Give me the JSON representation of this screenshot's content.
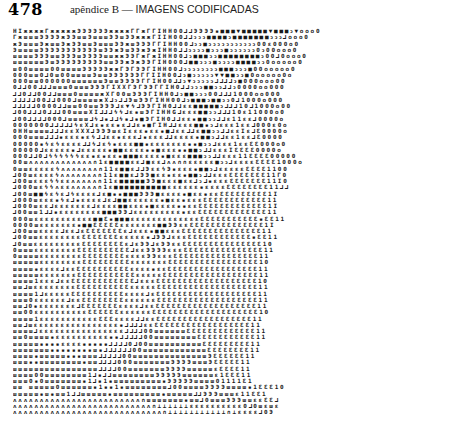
{
  "header": {
    "page_number": "478",
    "running_head_prefix": "apêndice B — ",
    "running_head_title": "IMAGENS CODIFICADAS"
  },
  "grid": {
    "columns": 61,
    "rows": [
      "HIжжжжГжжжжжЭЭЭЭЭЭжжжжГГжГГIHH00⅃⅃ЭЭЭЭ▪■■■▼■■■■■▼■■■ↄ▼ooo0",
      "ГжшшшЭЭЭЭжЭЭшшЭшшшЭЭшЭЭжжжГIIH00⅃⅃ↄↄↄ■■■■ↄ■■■■■■■ↄↄↄ⅃ooo0",
      "жЭшшшЭжшшЭжЭЭшшЭшшшЭЭжшЭЭЭГГIHH00⅃ↄↄ■ↄↄↄↄↄↄↄↄↄↄↄ00ɛ000o0",
      "ЭшшшшЭЭЭЭЭЭЭЭЭЭЭшЭЭжЭшЭЭжЭжIHH0⅃⅃ↄↄↄↄ■ↄↄↄ■ↄↄↄↄↄↄ0ↄ00ooo0",
      "шшшшЭЭЭшшЭЭЭшЭЭЭЭшшжжЭЭГжГжIHH00⅃ↄ■■■ↄↄ■■■■■■■■ↄ00⅃0ooo0",
      "шшшшшшЭшЭЭЭЭЭЭЭЭЭшшЭЭжЭжЭЭГIH000⅃■■ↄↄↄ■ↄↄↄↄ■■■■ↄↄ0ooooo0",
      "ш00шшшш00шшшшЭЭЭЭЭжжГЭГЭЭГIHH00⅃ↄↄↄↄↄↄↄↄ■■■ↄↄↄ■00ooooo0",
      "000шш0⅃0ш00шшшшЭшшЭЭЭЭЭЭГГIIH00⅃ↄ■ↄↄↄↄↄ▼▼■■ↄↄ■0ooooo0o",
      "000шш000000шшшшшшЭшшЭЭЭЭГГIH00⅃⅃ↄ▼ↄↄↄↄↄ⅃⅃⅃⅃ↄ■000ooo00",
      "0⅃⅃00⅃⅃⅃шшш0шшшЭЭЭГIXXГЭГЭЭГГIH0⅃⅃ↄↄↄ■■ↄↄ⅃⅃ↄ0000oo000",
      "⅃⅃0⅃⅃00⅃⅃шшш0шшшшжXГ00шЭЭЭГIHH0⅃ↄ■■ↄↄↄ00⅃⅃⅃1000oo000",
      "⅃⅃⅃⅃⅃00⅃⅃000⅃шшшшжX⅃ↄ⅃⅃ЭшЭЭГIHH00⅃ↄ■■■ↄ■■ↄↄ0⅃1000o000",
      "⅃⅃⅃⅃⅃0000⅃⅃шш00шшЭЭЭ⅃ɛ▼ϟ⅃ЭЭГIH0⅃⅃ɛɛ■■■■■ↄ⅃⅃⅃10⅃1000o00",
      "⅃00⅃⅃⅃0⅃⅃⅃00шшшXI⅃⅃⅃ϟϟ⅃ɛ▪шЭГIHHG⅃ɛɛɛ■■ↄↄ⅃⅃⅃10ɛ11000o0",
      "⅃00⅃⅃⅃⅃000⅃шшшш⅃ϟ⅃▪⅃⅃ϟ▪⅃▪■ЭГIH0⅃⅃ɛɛ▪■■ↄↄ⅃⅃ɛ11ɛɛ⅃0000o",
      "0000000⅃⅃⅃⅃⅃ϟɛX⅃ɛ▪ɛɛ▪ɛ⅃⅃ɛ▪■ГIH⅃⅃ɛɛɛ■■▪ↄ⅃ɛɛɛ1ɛɛ⅃000ɛ0o",
      "0HHшшшш⅃⅃⅃ɛɛXXX⅃ЭЭЭшɛIɛɛɛ▪ɛɛ▪■⅃ɛɛ⅃⅃ɛ■■ↄↄ⅃⅃ɛɛIɛ⅃Ɛ0000o",
      "000шшш⅃⅃⅃▪ɛɛɛ▪ɛϟ⅃⅃ɛɛ▪ɛɛɛ⅃▪ɛɛɛ⅃⅃ɛɛɛɛ▪■■ↄ⅃⅃ɛɛ1ɛɛ⅃Ɛ0000",
      "00000▪ϟɛϟɛɛɛɛ⅃⅃ϟ⅃ɛϟ▪ɛɛɛ■■▪ɛɛɛɛɛɛɛ▪▪■ↄↄ⅃ɛɛɛ1ɛɛƐƐ000o0",
      "00000⅃ɛɛɛɛɛ▪⅃ɛɛɛɛɛ▪■■ɛɛɛɛ▪▪■ɛɛɛ▪▪■■ↄ⅃⅃ɛɛɛIƐƐƐƐ0000o",
      "000⅃⅃0⅃ϟϟϟϟϟϟɛɛ▪ɛ▪ɛɛ▪■■■ɛɛɛɛ▪■ɛɛɛ■■■ↄↄ⅃⅃ɛɛɛ11ƐƐƐƐ00000",
      "00шʌʌʌʌʌʌʌʌʌʌʌʌ∩1ɛ■■■■ɛɛ⅃■ɛɛ⅃ʌʌ∩∩ɛɛɛɛɛ■ↄↄ⅃ɛɛɛɛƐƐƐƐ1000o",
      "0шшɛɛɛɛɛϟʌʌʌʌʌʌʌ∩11ɛ■■ɛ⅃⅃ЭɛɛϟЭ▪ɛɛɛ▪■■ↄ⅃ɛɛɛɛɛƐƐƐƐ1100",
      "⅃00шɛɛɛɛϟʌʌʌʌʌʌʌ∩11ɛ■■ɛ⅃ЭЭ■ɛɛ▪ɛɛ▪■■ↄ⅃⅃ɛɛɛƐƐƐƐƐƐƐ11Г0",
      "⅃00шɛɛɛϟϟɛɛʌʌʌʌʌ∩11ɛ■■■■■ЭЭ■ɛɛɛ■ɛɛ⅃ↄ⅃▪ɛɛɛƐƐƐƐƐƐƐ11I0",
      "⅃000шɛϟϟʌɛɛʌʌʌʌʌ∩1ɛ■■■■■■■■■■ɛɛɛɛɛɛ▪ɛɛɛɛƐƐƐƐƐƐƐƐ11⅃⅃",
      "⅃00ш■■ϟɛϟɛ⅃ϟɛɛɛɛ⅃ɛ■▪▪■■■ЭЭЭ■ɛɛɛɛ▪■ɛɛ▪ɛɛƐƐƐƐƐƐƐƐƐ1I",
      "⅃000шɛɛɛ▪ϟɛ⅃▪ɛɛɛɛ⅃ɛ⅃■■ɛɛɛɛɛɛ▪■ɛɛ▪ɛɛɛƐƐƐƐƐƐƐƐƐƐƐƐ11",
      "⅃000шɛɛ⅃ɛɛɛɛɛɛɛ⅃ɛɛɛɛ■■ɛɛɛ▪■ɛɛɛɛ▪▪ɛɛƐƐƐƐƐƐƐƐƐƐƐƐƐ1I",
      "⅃00шш1⅃⅃▪ɛɛɛɛɛɛɛɛ■■■ЭЭ⅃ɛɛɛɛɛɛɛɛɛ▪ɛɛƐƐƐƐƐƐƐƐƐƐƐƐƐ11",
      "000шɛɛɛɛɛɛɛɛɛɛɛ■■Ɛ▪■■■ɛɛɛɛɛɛɛɛɛɛɛɛɛƐƐƐƐƐƐƐƐƐƐƐ▪ƐƐ11",
      "0000шɛɛɛɛɛɛɛ▪■■ƐƐƐƐƐɛɛɛɛɛɛɛ■■ЭЭɛɛƐƐƐƐƐƐƐƐƐƐƐƐƐƐ1I",
      "⅃00шшɛɛɛɛ⅃ɛɛ⅃ɛƐƐƐƐƐƐƐɛ⅃ɛɛɛ▪■■ɛɛɛƐƐƐƐƐƐƐƐƐƐƐƐƐƐƐ11",
      "⅃00шшɛɛɛɛɛɛɛɛƐƐƐƐƐƐƐɛɛɛɛɛ▪⅃ЭЭ⅃ɛɛɛƐƐƐƐƐƐƐƐƐƐƐƐ▪ƐƐ11",
      "⅃0шшɛɛɛɛɛɛɛɛɛƐƐƐƐƐƐƐƐɛ⅃ɛЭЭ⅃ɛЭЭɛɛƐƐƐƐƐƐƐƐƐƐƐƐƐƐƐ10",
      "0шшшɛɛɛɛɛɛɛɛƐƐƐƐƐƐƐƐƐƐ⅃ɛɛЭЭЭЭɛɛɛƐƐƐƐƐƐƐƐƐƐƐƐƐƐƐ11",
      "0шшшшɛɛɛɛɛɛɛɛƐƐƐƐƐƐƐƐɛɛɛɛЭЭɛɛɛƐƐƐƐƐƐƐƐƐƐƐƐƐƐƐƐ11",
      "шшшшшɛɛɛɛɛɛɛɛƐƐƐƐƐƐƐƐƐɛɛɛɛɛɛɛƐƐƐƐƐƐƐƐƐƐƐƐƐƐƐƐƐ10",
      "шшшш▪ɛɛɛɛ⅃ɛɛƐƐƐƐƐƐƐƐƐƐɛɛɛɛ▪ɛɛƐƐƐƐƐƐƐƐƐƐƐƐƐƐƐƐƐ11",
      "шшшшшɛɛɛɛɛɛɛƐƐƐƐƐƐƐƐƐƐƐɛɛɛɛɛƐƐƐƐƐƐƐƐƐƐƐƐƐƐƐƐƐƐ11",
      "шшшш1ɛɛɛ⅃ɛɛƐƐƐƐƐƐƐƐƐƐƐƐ⅃ɛɛɛƐƐƐƐƐƐƐƐƐƐƐƐƐƐƐƐƐƐƐ10",
      "шш⅃шɛɛɛɛɛɛɛɛƐƐƐƐƐƐƐƐƐƐɛɛɛɛɛƐƐƐƐƐƐƐƐƐƐƐƐƐƐƐƐƐƐƐ11",
      "шшшш1⅃ɛɛɛɛɛƐƐƐƐƐƐƐƐƐƐɛɛɛɛ⅃ɛƐƐƐƐƐƐƐƐƐƐƐƐƐƐƐƐƐƐƐ11",
      "шшш0ɛɛɛɛɛɛ⅃ɛɛƐƐƐƐƐƐƐƐɛɛɛɛɛɛƐƐƐƐƐƐƐƐƐƐƐƐƐƐƐƐƐƐƐ11",
      "шш⅃0▪ɛɛɛɛɛɛɛ⅃ƐƐƐƐƐƐƐɛɛɛɛ⅃ɛɛƐƐƐƐƐƐƐƐƐƐƐƐƐƐƐƐƐƐƐ11",
      "шш00ɛɛɛɛɛɛɛɛɛɛƐƐƐƐƐƐɛɛɛɛɛɛƐƐƐƐƐƐƐƐƐƐƐƐƐƐƐƐƐƐƐƐ10",
      "шшшш1ɛɛɛɛɛɛɛɛɛɛɛƐƐƐɛɛɛɛ⅃⅃ɛɛƐƐƐƐƐƐƐƐƐƐƐƐƐƐƐƐƐƐ11",
      "шш⅃шɛɛɛɛɛɛɛɛɛɛɛɛɛɛɛɛ▪⅃⅃⅃⅃ɛɛƐƐƐƐƐƐƐƐƐƐƐƐƐƐƐƐƐƐ11",
      "шшшш⅃ɛɛɛɛɛɛɛɛɛɛɛɛɛɛɛɛ⅃⅃⅃⅃00шшшшшшƐƐƐƐƐƐƐƐƐƐƐƐƐ11",
      "шш0шшшш▪ɛɛɛɛɛɛɛɛɛɛ▪▪⅃⅃⅃⅃⅃00шшшшшшшшƐƐƐƐƐƐƐƐƐƐƐ11",
      "шшшшш▪▪▪▪ɛɛɛɛ▪▪▪▪▪⅃⅃⅃⅃0⅃00шшшшшшшшшшƐƐƐƐƐƐƐƐƐ11",
      "шшшшшшш▪▪▪▪▪▪▪▪ш▪⅃⅃⅃⅃⅃⅃00шшшшшшшшшшшшƐƐƐƐƐƐƐƐ11",
      "шшшш▪шшшшш▪▪▪шшш⅃⅃⅃⅃⅃00шшшшшшшшшшшшшшЭƐƐƐƐƐƐ11",
      "шшш▪▪шшшшшшшш▪шш⅃⅃⅃⅃000шшшшшшшЭЭЭЭшшшЭƐƐƐƐƐ11",
      "шшшшшшшшшшшшшшшш⅃⅃⅃⅃00шшшшшшшЭЭЭЭшшшшшɛƐƐƐƐ11",
      "шшшш00шшшшшшшш1⅃▪⅃⅃шшшшшшшшЭЭЭЭЭшшшшшшɛ1ƐƐƐ11",
      "шшш0▪0шшшшшшш▪1⅃▪1▪шшшшшшшшш▪ЭЭЭЭЭшшшш01111Ɛ1",
      "шш шшшшш0шшшшшш▪1▪▪1▪шшшшшшшш⅃00шшшшЭЭЭЭшшшш▪1ƐƐƐ10",
      "шшшшш▪ш▪шш1⅃⅃шшшшш▪шшшшшшшшш▪шшшшш⅃⅃ЭЭЭшшшɛ11ƐƐ1",
      "ʌʌʌʌʌʌʌʌʌʌʌʌʌʌʌʌʌʌʌʌʌʌʌʌ∩шшшшшшш▪шш⅃0шшшЭЭЭшшɛɛƐƐ⅃",
      "ʌʌʌʌʌʌʌʌʌʌʌʌʌʌʌʌʌʌʌʌʌʌʌʌʌʌ∩⊥⊥⊥⊥⊥⊥ɛɛɛɛɛɛɛɛɛɛ0⅃0шɛшɛ",
      "ʌʌʌʌʌʌʌʌʌʌʌʌʌʌʌʌʌʌʌʌʌʌʌʌʌʌʌʌ∩⊥⊥⊥⊥⊥⊥⊥⊥⊥⊥⊥∩⊥ɛɛɛɛ⅃0Э"
    ]
  }
}
